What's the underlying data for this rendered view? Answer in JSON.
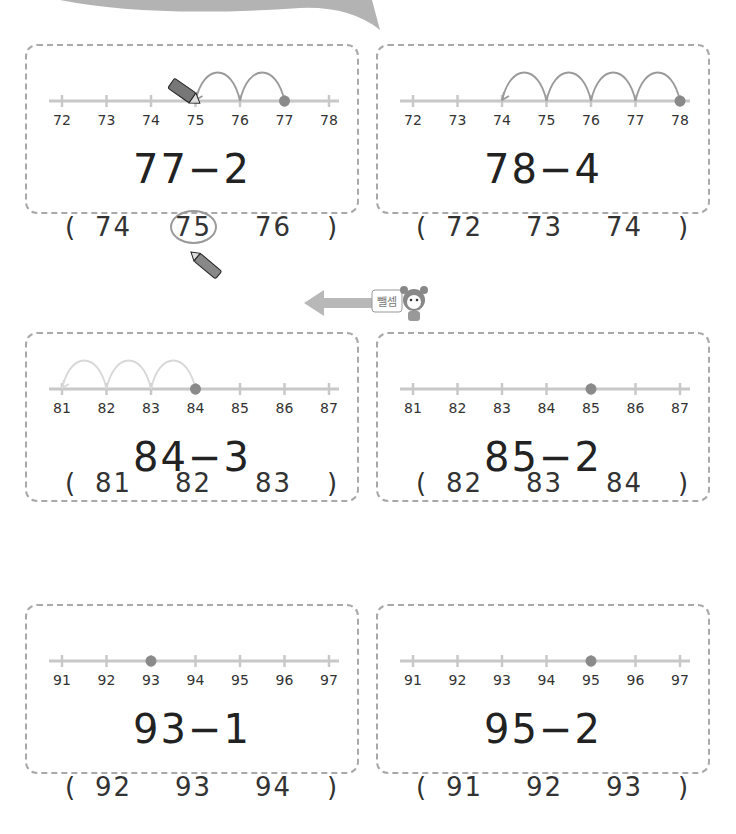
{
  "hint": {
    "speech_label": "뺄셈",
    "arrow": "left-arrow-icon"
  },
  "problems": [
    {
      "expression": "77−2",
      "ticks": [
        "72",
        "73",
        "74",
        "75",
        "76",
        "77",
        "78"
      ],
      "start_index": 5,
      "hops": 2,
      "show_hops": true,
      "hop_color": "#9a9a9a",
      "choices": {
        "open": "(",
        "close": ")",
        "options": [
          "74",
          "75",
          "76"
        ],
        "selected_index": 1
      }
    },
    {
      "expression": "78−4",
      "ticks": [
        "72",
        "73",
        "74",
        "75",
        "76",
        "77",
        "78"
      ],
      "start_index": 6,
      "hops": 4,
      "show_hops": true,
      "hop_color": "#9a9a9a",
      "choices": {
        "open": "(",
        "close": ")",
        "options": [
          "72",
          "73",
          "74"
        ],
        "selected_index": null
      }
    },
    {
      "expression": "84−3",
      "ticks": [
        "81",
        "82",
        "83",
        "84",
        "85",
        "86",
        "87"
      ],
      "start_index": 3,
      "hops": 3,
      "show_hops": true,
      "hop_color": "#d8d8d8",
      "choices": {
        "open": "(",
        "close": ")",
        "options": [
          "81",
          "82",
          "83"
        ],
        "selected_index": null
      }
    },
    {
      "expression": "85−2",
      "ticks": [
        "81",
        "82",
        "83",
        "84",
        "85",
        "86",
        "87"
      ],
      "start_index": 4,
      "hops": 0,
      "show_hops": false,
      "hop_color": "#9a9a9a",
      "choices": {
        "open": "(",
        "close": ")",
        "options": [
          "82",
          "83",
          "84"
        ],
        "selected_index": null
      }
    },
    {
      "expression": "93−1",
      "ticks": [
        "91",
        "92",
        "93",
        "94",
        "95",
        "96",
        "97"
      ],
      "start_index": 2,
      "hops": 0,
      "show_hops": false,
      "hop_color": "#9a9a9a",
      "choices": {
        "open": "(",
        "close": ")",
        "options": [
          "92",
          "93",
          "94"
        ],
        "selected_index": null
      }
    },
    {
      "expression": "95−2",
      "ticks": [
        "91",
        "92",
        "93",
        "94",
        "95",
        "96",
        "97"
      ],
      "start_index": 4,
      "hops": 0,
      "show_hops": false,
      "hop_color": "#9a9a9a",
      "choices": {
        "open": "(",
        "close": ")",
        "options": [
          "91",
          "92",
          "93"
        ],
        "selected_index": null
      }
    }
  ],
  "colors": {
    "line": "#c8c8c8",
    "dot": "#8a8a8a",
    "circle": "#9a9a9a",
    "banner": "#b3b3b3",
    "arrow": "#b8b8b8"
  }
}
